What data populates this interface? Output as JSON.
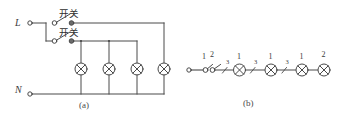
{
  "figure": {
    "title_a": "(a)",
    "title_b": "(b)",
    "stroke_color": "#4a4a4a",
    "text_color": "#3a3a3a",
    "background": "#ffffff"
  },
  "diagram_a": {
    "caption": "(a)",
    "terminals": [
      {
        "name": "line-terminal",
        "label": "L"
      },
      {
        "name": "neutral-terminal",
        "label": "N"
      }
    ],
    "switches": [
      {
        "label": "开关",
        "position": "upper"
      },
      {
        "label": "开关",
        "position": "lower"
      }
    ],
    "lamps": [
      {
        "symbol": "⊗"
      },
      {
        "symbol": "⊗"
      },
      {
        "symbol": "⊗"
      },
      {
        "symbol": "⊗"
      }
    ],
    "lamp_count": 4
  },
  "diagram_b": {
    "caption": "(b)",
    "wire_markers": [
      "1",
      "2",
      "3",
      "3",
      "3"
    ],
    "lamp_markers": [
      "1",
      "1",
      "1",
      "2"
    ],
    "lamps": [
      {
        "symbol": "⊗",
        "marker": "1"
      },
      {
        "symbol": "⊗",
        "marker": "1"
      },
      {
        "symbol": "⊗",
        "marker": "1"
      },
      {
        "symbol": "⊗",
        "marker": "2"
      }
    ],
    "switch_markers": [
      "1",
      "2"
    ],
    "segment_markers": [
      "3",
      "3",
      "3"
    ]
  }
}
